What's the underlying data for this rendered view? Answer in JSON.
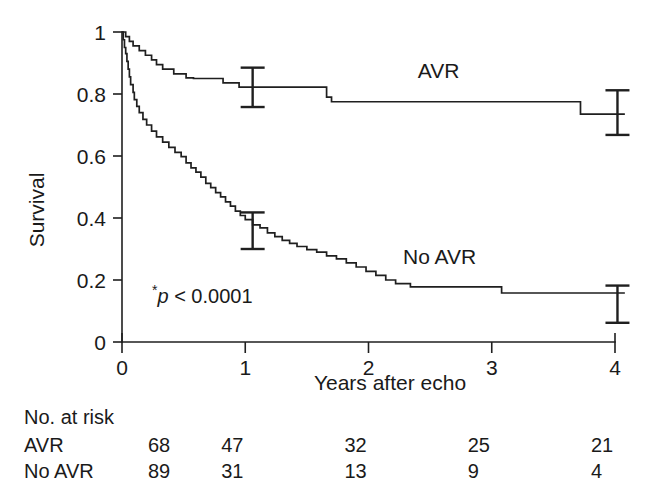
{
  "chart_data": {
    "type": "line",
    "subtype": "kaplan-meier-survival",
    "title": "",
    "xlabel": "Years after echo",
    "ylabel": "Survival",
    "xlim": [
      0,
      4
    ],
    "ylim": [
      0,
      1
    ],
    "grid": false,
    "xticks": [
      0,
      1,
      2,
      3,
      4
    ],
    "xticklabels": [
      "0",
      "1",
      "2",
      "3",
      "4"
    ],
    "yticks": [
      0,
      0.2,
      0.4,
      0.6,
      0.8,
      1
    ],
    "yticklabels": [
      "0",
      "0.2",
      "0.4",
      "0.6",
      "0.8",
      "1"
    ],
    "annotations": [
      {
        "name": "p-value",
        "text": "*p < 0.0001",
        "x": 0.22,
        "y": 0.115
      }
    ],
    "legend_position": "inline-labels",
    "series": [
      {
        "name": "AVR",
        "label": "AVR",
        "label_x": 2.4,
        "label_y": 0.875,
        "steps": [
          [
            0.0,
            1.0
          ],
          [
            0.03,
            0.985
          ],
          [
            0.06,
            0.97
          ],
          [
            0.09,
            0.955
          ],
          [
            0.14,
            0.94
          ],
          [
            0.19,
            0.925
          ],
          [
            0.24,
            0.91
          ],
          [
            0.28,
            0.895
          ],
          [
            0.33,
            0.88
          ],
          [
            0.42,
            0.865
          ],
          [
            0.52,
            0.852
          ],
          [
            0.58,
            0.85
          ],
          [
            0.82,
            0.836
          ],
          [
            0.95,
            0.822
          ],
          [
            1.62,
            0.822
          ],
          [
            1.66,
            0.79
          ],
          [
            1.7,
            0.775
          ],
          [
            3.68,
            0.775
          ],
          [
            3.72,
            0.735
          ],
          [
            4.08,
            0.735
          ]
        ],
        "error_bars": [
          {
            "x": 1.06,
            "y": 0.822,
            "low": 0.758,
            "high": 0.885
          },
          {
            "x": 4.02,
            "y": 0.735,
            "low": 0.668,
            "high": 0.812
          }
        ]
      },
      {
        "name": "No AVR",
        "label": "No AVR",
        "label_x": 2.28,
        "label_y": 0.275,
        "steps": [
          [
            0.0,
            1.0
          ],
          [
            0.01,
            0.975
          ],
          [
            0.02,
            0.95
          ],
          [
            0.03,
            0.93
          ],
          [
            0.04,
            0.905
          ],
          [
            0.05,
            0.88
          ],
          [
            0.06,
            0.855
          ],
          [
            0.07,
            0.83
          ],
          [
            0.09,
            0.805
          ],
          [
            0.1,
            0.782
          ],
          [
            0.12,
            0.76
          ],
          [
            0.14,
            0.74
          ],
          [
            0.17,
            0.718
          ],
          [
            0.2,
            0.7
          ],
          [
            0.24,
            0.68
          ],
          [
            0.28,
            0.662
          ],
          [
            0.33,
            0.645
          ],
          [
            0.38,
            0.628
          ],
          [
            0.43,
            0.612
          ],
          [
            0.48,
            0.598
          ],
          [
            0.52,
            0.578
          ],
          [
            0.56,
            0.562
          ],
          [
            0.6,
            0.548
          ],
          [
            0.64,
            0.532
          ],
          [
            0.68,
            0.512
          ],
          [
            0.72,
            0.498
          ],
          [
            0.76,
            0.482
          ],
          [
            0.8,
            0.468
          ],
          [
            0.84,
            0.452
          ],
          [
            0.88,
            0.438
          ],
          [
            0.92,
            0.422
          ],
          [
            0.96,
            0.408
          ],
          [
            1.0,
            0.395
          ],
          [
            1.06,
            0.378
          ],
          [
            1.12,
            0.368
          ],
          [
            1.18,
            0.352
          ],
          [
            1.24,
            0.34
          ],
          [
            1.3,
            0.328
          ],
          [
            1.36,
            0.318
          ],
          [
            1.42,
            0.308
          ],
          [
            1.5,
            0.298
          ],
          [
            1.58,
            0.29
          ],
          [
            1.66,
            0.278
          ],
          [
            1.74,
            0.268
          ],
          [
            1.82,
            0.255
          ],
          [
            1.9,
            0.242
          ],
          [
            1.98,
            0.228
          ],
          [
            2.06,
            0.215
          ],
          [
            2.14,
            0.2
          ],
          [
            2.22,
            0.188
          ],
          [
            2.34,
            0.178
          ],
          [
            3.02,
            0.178
          ],
          [
            3.08,
            0.158
          ],
          [
            4.08,
            0.158
          ]
        ],
        "error_bars": [
          {
            "x": 1.06,
            "y": 0.372,
            "low": 0.3,
            "high": 0.418
          },
          {
            "x": 4.02,
            "y": 0.122,
            "low": 0.062,
            "high": 0.182
          }
        ]
      }
    ]
  },
  "risk_table": {
    "header": "No. at risk",
    "row_labels": [
      "AVR",
      "No AVR"
    ],
    "time_points": [
      0,
      1,
      2,
      3,
      4
    ],
    "rows": [
      {
        "label": "AVR",
        "values": [
          "68",
          "47",
          "32",
          "25",
          "21"
        ]
      },
      {
        "label": "No AVR",
        "values": [
          "89",
          "31",
          "13",
          "9",
          "4"
        ]
      }
    ]
  },
  "colors": {
    "ink": "#1a1a1a",
    "background": "#ffffff"
  }
}
